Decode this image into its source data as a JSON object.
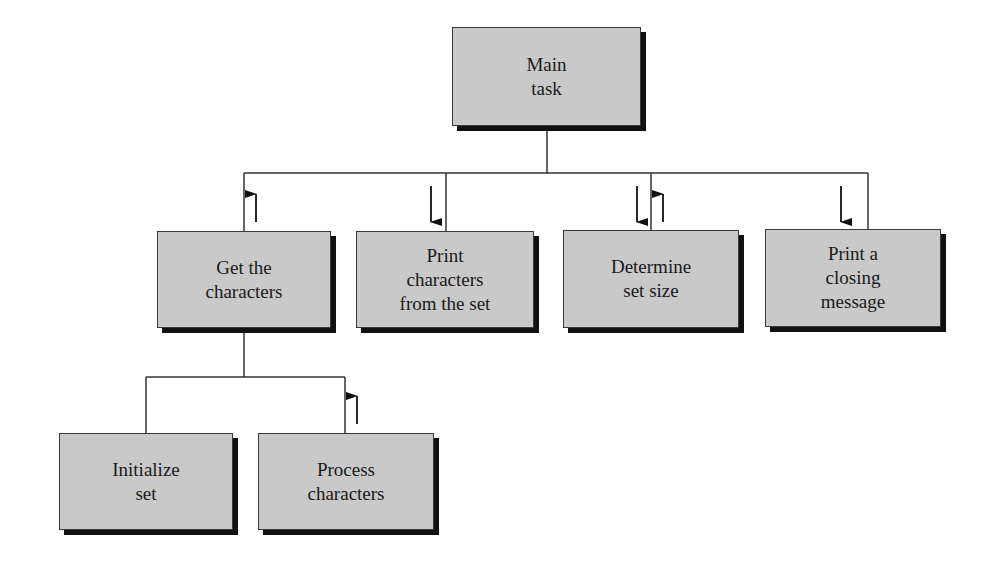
{
  "diagram": {
    "type": "structure-chart",
    "colors": {
      "box_fill": "#c9c9c9",
      "box_border": "#3a3a3a",
      "shadow": "#111111",
      "line": "#333333"
    },
    "nodes": {
      "main": {
        "label": "Main\ntask"
      },
      "get_chars": {
        "label": "Get the\ncharacters"
      },
      "print_chars": {
        "label": "Print\ncharacters\nfrom the set"
      },
      "determine": {
        "label": "Determine\nset size"
      },
      "closing": {
        "label": "Print a\nclosing\nmessage"
      },
      "init_set": {
        "label": "Initialize\nset"
      },
      "process": {
        "label": "Process\ncharacters"
      }
    },
    "edges": [
      {
        "from": "main",
        "to": "get_chars",
        "data_flow": [
          "up"
        ]
      },
      {
        "from": "main",
        "to": "print_chars",
        "data_flow": [
          "down"
        ]
      },
      {
        "from": "main",
        "to": "determine",
        "data_flow": [
          "down",
          "up"
        ]
      },
      {
        "from": "main",
        "to": "closing",
        "data_flow": [
          "down"
        ]
      },
      {
        "from": "get_chars",
        "to": "init_set",
        "data_flow": []
      },
      {
        "from": "get_chars",
        "to": "process",
        "data_flow": [
          "up"
        ]
      }
    ]
  }
}
